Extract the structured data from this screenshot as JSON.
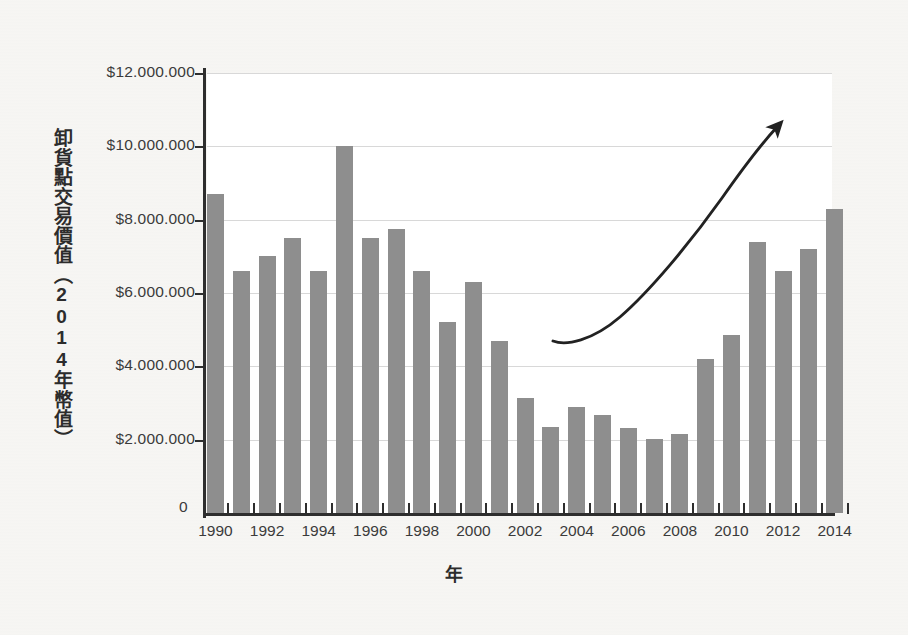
{
  "figure": {
    "background_color": "#f2f1ee",
    "plot_background_color": "#ffffff",
    "bar_color": "#8e8e8e",
    "gridline_color": "#d8d8d8",
    "axis_color": "#2e2e2e",
    "annotation_color": "#222222"
  },
  "axes": {
    "y_title": "卸貨點交易價值（2014年幣值）",
    "x_title": "年",
    "y_tick_labels": [
      "$12.000.000",
      "$10.000.000",
      "$8.000.000",
      "$6.000.000",
      "$4.000.000",
      "$2.000.000"
    ],
    "y_tick_values": [
      12000000,
      10000000,
      8000000,
      6000000,
      4000000,
      2000000
    ],
    "zero_label": "0",
    "x_tick_labels": [
      "1990",
      "1992",
      "1994",
      "1996",
      "1998",
      "2000",
      "2002",
      "2004",
      "2006",
      "2008",
      "2010",
      "2012",
      "2014"
    ]
  },
  "annotation": {
    "name": "upward-trend-arrow",
    "description": "hand-drawn curved arrow rising from 2003 to 2014"
  },
  "chart_data": {
    "type": "bar",
    "title": "",
    "xlabel": "年",
    "ylabel": "卸貨點交易價值（2014年幣值）",
    "ylim": [
      0,
      12000000
    ],
    "ytick_step": 2000000,
    "grid": true,
    "legend": false,
    "categories": [
      "1990",
      "1991",
      "1992",
      "1993",
      "1994",
      "1995",
      "1996",
      "1997",
      "1998",
      "1999",
      "2000",
      "2001",
      "2002",
      "2003",
      "2004",
      "2005",
      "2006",
      "2007",
      "2008",
      "2009",
      "2010",
      "2011",
      "2012",
      "2013",
      "2014"
    ],
    "values": [
      8700000,
      6600000,
      7000000,
      7500000,
      6600000,
      10000000,
      7500000,
      7750000,
      6600000,
      5200000,
      6300000,
      4700000,
      3150000,
      2350000,
      2900000,
      2670000,
      2320000,
      2020000,
      2150000,
      4200000,
      4850000,
      7400000,
      6600000,
      7200000,
      8300000
    ]
  }
}
